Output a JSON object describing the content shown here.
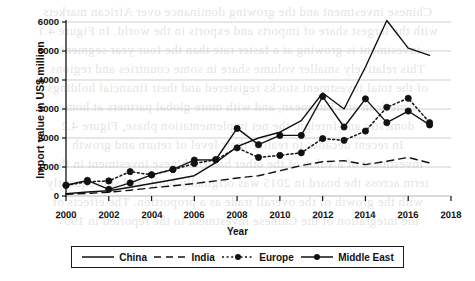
{
  "chart_data": {
    "type": "line",
    "title": "",
    "xlabel": "Year",
    "ylabel": "Import value in US$ million",
    "xlim": [
      2000,
      2018
    ],
    "ylim": [
      0,
      6000
    ],
    "xticks": [
      2000,
      2002,
      2004,
      2006,
      2008,
      2010,
      2012,
      2014,
      2016,
      2018
    ],
    "yticks": [
      0,
      1000,
      2000,
      3000,
      4000,
      5000,
      6000
    ],
    "grid": "horizontal",
    "legend_position": "bottom",
    "x": [
      2000,
      2001,
      2002,
      2003,
      2004,
      2005,
      2006,
      2007,
      2008,
      2009,
      2010,
      2011,
      2012,
      2013,
      2014,
      2015,
      2016,
      2017
    ],
    "series": [
      {
        "name": "China",
        "style": "solid",
        "markers": false,
        "color": "#111111",
        "values": [
          80,
          140,
          180,
          300,
          430,
          560,
          700,
          1150,
          1700,
          2000,
          2200,
          2600,
          3550,
          3000,
          4450,
          6050,
          5100,
          4850
        ]
      },
      {
        "name": "India",
        "style": "dashed",
        "markers": false,
        "color": "#111111",
        "values": [
          60,
          90,
          130,
          200,
          280,
          350,
          430,
          520,
          620,
          700,
          870,
          1050,
          1180,
          1220,
          1080,
          1200,
          1330,
          1140
        ]
      },
      {
        "name": "Europe",
        "style": "dotted",
        "markers": true,
        "color": "#111111",
        "values": [
          370,
          490,
          520,
          840,
          730,
          910,
          1120,
          1250,
          1660,
          1330,
          1400,
          1490,
          1980,
          1920,
          2240,
          3060,
          3370,
          2530
        ]
      },
      {
        "name": "Middle East",
        "style": "solid",
        "markers": true,
        "color": "#111111",
        "values": [
          370,
          540,
          230,
          450,
          730,
          920,
          1240,
          1250,
          2330,
          1770,
          2090,
          2090,
          3430,
          2380,
          3350,
          2530,
          2930,
          2450
        ]
      }
    ]
  },
  "legend": {
    "items": [
      {
        "label": "China"
      },
      {
        "label": "India"
      },
      {
        "label": "Europe"
      },
      {
        "label": "Middle East"
      }
    ]
  },
  "bleed_text": {
    "lines": [
      "Chinese investment and the growing dominance over African markets",
      "with the largest share of imports and exports in the world. In Figure 4.1",
      "investment is growing at a faster rate than the four year segments",
      "This relatively smaller volume share in some countries and regions",
      "of the total investment stocks registered and their financial holdings",
      "American and European, and with more global partners at home",
      "domestic and foreign, the net implementation phase, Figure 4.2",
      "In recent decades to realize their level of return and growth",
      "investment of a value of the other hand, Chinese investment in the",
      "term across the board in 2015 was originally built, and subsequently",
      "with the growth of the overall trade as a proportion. The effects of",
      "the integration of the Chinese investment to the reported in 1997"
    ]
  }
}
